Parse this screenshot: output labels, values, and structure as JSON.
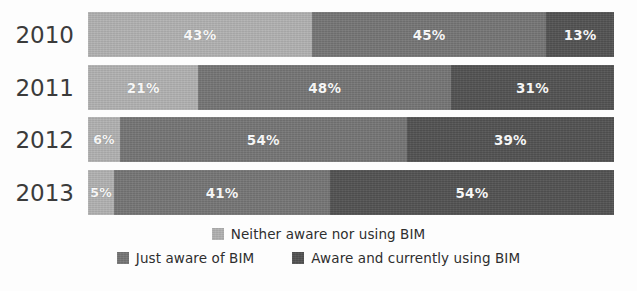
{
  "chart_data": {
    "type": "bar",
    "orientation": "horizontal",
    "stacked": true,
    "normalized_percent": true,
    "title": "",
    "subtitle": "",
    "xlabel": "",
    "ylabel": "",
    "xlim": [
      0,
      100
    ],
    "grid": false,
    "legend_position": "bottom",
    "categories": [
      "2010",
      "2011",
      "2012",
      "2013"
    ],
    "series": [
      {
        "name": "Neither aware nor using BIM",
        "color": "#b2b2b2",
        "values": [
          43,
          21,
          6,
          5
        ],
        "labels": [
          "43%",
          "21%",
          "6%",
          "5%"
        ]
      },
      {
        "name": "Just aware of BIM",
        "color": "#767676",
        "values": [
          45,
          48,
          54,
          41
        ],
        "labels": [
          "45%",
          "48%",
          "54%",
          "41%"
        ]
      },
      {
        "name": "Aware and currently using BIM",
        "color": "#535353",
        "values": [
          13,
          31,
          39,
          54
        ],
        "labels": [
          "13%",
          "31%",
          "39%",
          "54%"
        ]
      }
    ]
  },
  "axis": {
    "year_labels": [
      "2010",
      "2011",
      "2012",
      "2013"
    ]
  },
  "legend": {
    "row1": [
      {
        "label": "Neither aware nor using BIM",
        "swatch": "#b2b2b2"
      }
    ],
    "row2": [
      {
        "label": "Just aware of BIM",
        "swatch": "#767676"
      },
      {
        "label": "Aware and currently using BIM",
        "swatch": "#535353"
      }
    ]
  },
  "colors": {
    "background": "#fdfdfd",
    "series_light": "#b2b2b2",
    "series_mid": "#767676",
    "series_dark": "#535353",
    "label_text": "#3b3b3b",
    "bar_value_text": "#ffffff"
  }
}
